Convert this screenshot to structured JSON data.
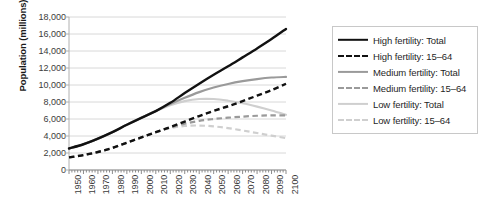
{
  "chart_data": {
    "type": "line",
    "title": "",
    "xlabel": "",
    "ylabel": "Population (millions)",
    "xlim": [
      1950,
      2100
    ],
    "ylim": [
      0,
      18000
    ],
    "ytick_step": 2000,
    "xtick_step": 10,
    "grid": "horizontal",
    "legend_position": "right",
    "ytick_labels": [
      "0",
      "2,000",
      "4,000",
      "6,000",
      "8,000",
      "10,000",
      "12,000",
      "14,000",
      "16,000",
      "18,000"
    ],
    "ytick_values": [
      0,
      2000,
      4000,
      6000,
      8000,
      10000,
      12000,
      14000,
      16000,
      18000
    ],
    "xtick_labels": [
      "1950",
      "1960",
      "1970",
      "1980",
      "1990",
      "2000",
      "2010",
      "2020",
      "2030",
      "2040",
      "2050",
      "2060",
      "2070",
      "2080",
      "2090",
      "2100"
    ],
    "x": [
      1950,
      1960,
      1970,
      1980,
      1990,
      2000,
      2010,
      2020,
      2030,
      2040,
      2050,
      2060,
      2070,
      2080,
      2090,
      2100
    ],
    "series": [
      {
        "name": "High fertility: Total",
        "color": "#111111",
        "style": "solid",
        "width": 2.4,
        "values": [
          2530,
          3030,
          3690,
          4450,
          5320,
          6140,
          6930,
          7900,
          9050,
          10150,
          11200,
          12200,
          13250,
          14300,
          15400,
          16600
        ]
      },
      {
        "name": "High fertility: 15–64",
        "color": "#111111",
        "style": "dashed",
        "width": 2.4,
        "values": [
          1480,
          1760,
          2120,
          2600,
          3220,
          3830,
          4450,
          5050,
          5700,
          6350,
          6950,
          7500,
          8100,
          8750,
          9400,
          10150
        ]
      },
      {
        "name": "Medium fertility: Total",
        "color": "#9a9a9a",
        "style": "solid",
        "width": 2.2,
        "values": [
          2530,
          3030,
          3690,
          4450,
          5320,
          6140,
          6930,
          7760,
          8500,
          9160,
          9700,
          10120,
          10450,
          10700,
          10880,
          10950
        ]
      },
      {
        "name": "Medium fertility: 15–64",
        "color": "#9a9a9a",
        "style": "dashed",
        "width": 2.2,
        "values": [
          1480,
          1760,
          2120,
          2600,
          3220,
          3830,
          4450,
          5000,
          5450,
          5780,
          6000,
          6150,
          6280,
          6380,
          6430,
          6420
        ]
      },
      {
        "name": "Low fertility: Total",
        "color": "#cfcfcf",
        "style": "solid",
        "width": 2.2,
        "values": [
          2530,
          3030,
          3690,
          4450,
          5320,
          6140,
          6930,
          7620,
          8100,
          8350,
          8350,
          8150,
          7850,
          7450,
          7000,
          6500
        ]
      },
      {
        "name": "Low fertility: 15–64",
        "color": "#cfcfcf",
        "style": "dashed",
        "width": 2.2,
        "values": [
          1480,
          1760,
          2120,
          2600,
          3220,
          3830,
          4450,
          4930,
          5180,
          5230,
          5130,
          4920,
          4650,
          4350,
          4050,
          3750
        ]
      }
    ]
  },
  "legend": {
    "entries": [
      {
        "label": "High fertility: Total"
      },
      {
        "label": "High fertility: 15–64"
      },
      {
        "label": "Medium fertility: Total"
      },
      {
        "label": "Medium fertility: 15–64"
      },
      {
        "label": "Low fertility: Total"
      },
      {
        "label": "Low fertility: 15–64"
      }
    ]
  },
  "colors": {
    "high": "#111111",
    "medium": "#9a9a9a",
    "low": "#cfcfcf",
    "grid": "#d8d8d8",
    "axis": "#b0b0b0",
    "text": "#3b3b3b"
  }
}
